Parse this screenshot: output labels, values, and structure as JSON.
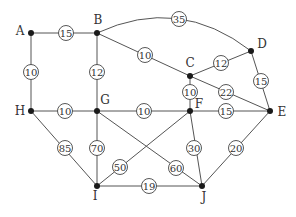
{
  "graph": {
    "nodes": [
      {
        "id": "A",
        "x": 31,
        "y": 33,
        "lx": 20,
        "ly": 31
      },
      {
        "id": "B",
        "x": 97,
        "y": 33,
        "lx": 98,
        "ly": 20
      },
      {
        "id": "C",
        "x": 190,
        "y": 76,
        "lx": 190,
        "ly": 63
      },
      {
        "id": "D",
        "x": 251,
        "y": 51,
        "lx": 262,
        "ly": 44
      },
      {
        "id": "E",
        "x": 270,
        "y": 111,
        "lx": 282,
        "ly": 112
      },
      {
        "id": "F",
        "x": 190,
        "y": 111,
        "lx": 199,
        "ly": 104
      },
      {
        "id": "G",
        "x": 97,
        "y": 111,
        "lx": 105,
        "ly": 100
      },
      {
        "id": "H",
        "x": 31,
        "y": 111,
        "lx": 20,
        "ly": 111
      },
      {
        "id": "I",
        "x": 97,
        "y": 186,
        "lx": 95,
        "ly": 196
      },
      {
        "id": "J",
        "x": 202,
        "y": 186,
        "lx": 204,
        "ly": 197
      }
    ],
    "edges": [
      {
        "from": "A",
        "to": "B",
        "weight": "15",
        "wx": 66,
        "wy": 33
      },
      {
        "from": "A",
        "to": "H",
        "weight": "10",
        "wx": 31,
        "wy": 72
      },
      {
        "from": "B",
        "to": "G",
        "weight": "12",
        "wx": 97,
        "wy": 72
      },
      {
        "from": "B",
        "to": "C",
        "weight": "10",
        "wx": 145,
        "wy": 55
      },
      {
        "from": "B",
        "to": "D",
        "weight": "35",
        "wx": 179,
        "wy": 19,
        "curve": true
      },
      {
        "from": "C",
        "to": "D",
        "weight": "12",
        "wx": 221,
        "wy": 63
      },
      {
        "from": "C",
        "to": "F",
        "weight": "10",
        "wx": 190,
        "wy": 92
      },
      {
        "from": "C",
        "to": "E",
        "weight": "22",
        "wx": 226,
        "wy": 92
      },
      {
        "from": "D",
        "to": "E",
        "weight": "15",
        "wx": 261,
        "wy": 81
      },
      {
        "from": "H",
        "to": "G",
        "weight": "10",
        "wx": 65,
        "wy": 111
      },
      {
        "from": "G",
        "to": "F",
        "weight": "10",
        "wx": 144,
        "wy": 111
      },
      {
        "from": "F",
        "to": "E",
        "weight": "15",
        "wx": 226,
        "wy": 111
      },
      {
        "from": "H",
        "to": "I",
        "weight": "85",
        "wx": 65,
        "wy": 148
      },
      {
        "from": "G",
        "to": "I",
        "weight": "70",
        "wx": 97,
        "wy": 148
      },
      {
        "from": "I",
        "to": "F",
        "weight": "50",
        "wx": 120,
        "wy": 167
      },
      {
        "from": "G",
        "to": "J",
        "weight": "60",
        "wx": 176,
        "wy": 168
      },
      {
        "from": "F",
        "to": "J",
        "weight": "30",
        "wx": 194,
        "wy": 148
      },
      {
        "from": "E",
        "to": "J",
        "weight": "20",
        "wx": 236,
        "wy": 148
      },
      {
        "from": "I",
        "to": "J",
        "weight": "19",
        "wx": 149,
        "wy": 186
      }
    ]
  }
}
